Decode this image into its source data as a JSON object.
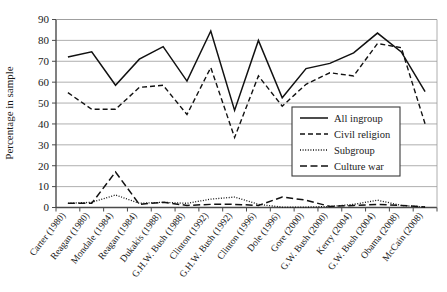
{
  "chart_data": {
    "type": "line",
    "title": "",
    "xlabel": "",
    "ylabel": "Percentage in sample",
    "ylim": [
      0,
      90
    ],
    "ytick_step": 10,
    "yticks": [
      "0",
      "10",
      "20",
      "30",
      "40",
      "50",
      "60",
      "70",
      "80",
      "90"
    ],
    "grid": true,
    "legend_position": "center-right",
    "categories": [
      "Carter (1980)",
      "Reagan (1980)",
      "Mondale (1984)",
      "Reagan (1984)",
      "Dukakis (1988)",
      "G.H.W. Bush (1988)",
      "Clinton (1992)",
      "G.H.W. Bush (1992)",
      "Clinton (1996)",
      "Dole (1996)",
      "Gore (2000)",
      "G.W. Bush (2000)",
      "Kerry (2004)",
      "G.W. Bush (2004)",
      "Obama (2008)",
      "McCain (2008)"
    ],
    "series": [
      {
        "name": "All ingroup",
        "style": "solid",
        "color": "#111111",
        "values": [
          72,
          74.5,
          58.5,
          71,
          77,
          60.5,
          84.5,
          46.5,
          80,
          52.5,
          66.5,
          69,
          74,
          83.5,
          74.5,
          55.5
        ]
      },
      {
        "name": "Civil religion",
        "style": "dashed",
        "color": "#111111",
        "values": [
          55,
          47,
          47,
          57.5,
          58.5,
          44.5,
          67,
          33.5,
          63,
          48.5,
          59,
          64.5,
          63,
          78.5,
          76.5,
          40
        ]
      },
      {
        "name": "Subgroup",
        "style": "dotted",
        "color": "#111111",
        "values": [
          2,
          2.5,
          6,
          2,
          2.5,
          2,
          4,
          5,
          1.5,
          0.2,
          0.2,
          0.5,
          1.5,
          3.5,
          1,
          0.2
        ]
      },
      {
        "name": "Culture war",
        "style": "longdash",
        "color": "#111111",
        "values": [
          2,
          2,
          17,
          1.5,
          2.5,
          1,
          1.5,
          1.5,
          1,
          5,
          3.5,
          0.5,
          1,
          1.5,
          1,
          0.2
        ]
      }
    ]
  },
  "legend": {
    "entries": [
      {
        "label": "All ingroup"
      },
      {
        "label": "Civil religion"
      },
      {
        "label": "Subgroup"
      },
      {
        "label": "Culture war"
      }
    ]
  }
}
